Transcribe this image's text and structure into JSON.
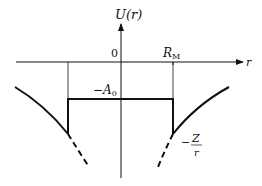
{
  "diagram": {
    "y_axis_label": "U(r)",
    "x_axis_label": "r",
    "origin_label": "0",
    "radius_label": "R",
    "radius_subscript": "M",
    "well_depth_label": "−A",
    "well_depth_subscript": "0",
    "coulomb_label_numerator": "Z",
    "coulomb_label_denominator": "r",
    "coulomb_label_sign": "−"
  }
}
